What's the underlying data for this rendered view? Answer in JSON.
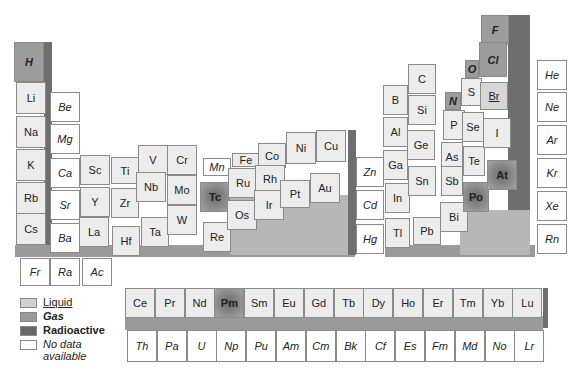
{
  "legend": [
    {
      "key": "liquid",
      "label": "Liquid"
    },
    {
      "key": "gas",
      "label": "Gas"
    },
    {
      "key": "radioactive",
      "label": "Radioactive"
    },
    {
      "key": "nodata",
      "label": "No data available"
    }
  ],
  "elements": [
    {
      "symbol": "H",
      "state": "gas"
    },
    {
      "symbol": "Li",
      "state": "solid"
    },
    {
      "symbol": "Na",
      "state": "solid"
    },
    {
      "symbol": "K",
      "state": "solid"
    },
    {
      "symbol": "Rb",
      "state": "solid"
    },
    {
      "symbol": "Cs",
      "state": "solid"
    },
    {
      "symbol": "Fr",
      "state": "nodata"
    },
    {
      "symbol": "Be",
      "state": "nodata"
    },
    {
      "symbol": "Mg",
      "state": "nodata"
    },
    {
      "symbol": "Ca",
      "state": "nodata"
    },
    {
      "symbol": "Sr",
      "state": "nodata"
    },
    {
      "symbol": "Ba",
      "state": "nodata"
    },
    {
      "symbol": "Ra",
      "state": "nodata"
    },
    {
      "symbol": "Sc",
      "state": "solid"
    },
    {
      "symbol": "Y",
      "state": "solid"
    },
    {
      "symbol": "La",
      "state": "solid"
    },
    {
      "symbol": "Ac",
      "state": "nodata"
    },
    {
      "symbol": "Ti",
      "state": "solid"
    },
    {
      "symbol": "Zr",
      "state": "solid"
    },
    {
      "symbol": "Hf",
      "state": "solid"
    },
    {
      "symbol": "V",
      "state": "solid"
    },
    {
      "symbol": "Nb",
      "state": "solid"
    },
    {
      "symbol": "Ta",
      "state": "solid"
    },
    {
      "symbol": "Cr",
      "state": "solid"
    },
    {
      "symbol": "Mo",
      "state": "solid"
    },
    {
      "symbol": "W",
      "state": "solid"
    },
    {
      "symbol": "Mn",
      "state": "nodata"
    },
    {
      "symbol": "Tc",
      "state": "radioactive"
    },
    {
      "symbol": "Re",
      "state": "solid"
    },
    {
      "symbol": "Fe",
      "state": "solid"
    },
    {
      "symbol": "Ru",
      "state": "solid"
    },
    {
      "symbol": "Os",
      "state": "solid"
    },
    {
      "symbol": "Co",
      "state": "solid"
    },
    {
      "symbol": "Rh",
      "state": "solid"
    },
    {
      "symbol": "Ir",
      "state": "solid"
    },
    {
      "symbol": "Ni",
      "state": "solid"
    },
    {
      "symbol": "Pt",
      "state": "solid"
    },
    {
      "symbol": "Cu",
      "state": "solid"
    },
    {
      "symbol": "Au",
      "state": "solid"
    },
    {
      "symbol": "Zn",
      "state": "nodata"
    },
    {
      "symbol": "Cd",
      "state": "nodata"
    },
    {
      "symbol": "Hg",
      "state": "nodata"
    },
    {
      "symbol": "B",
      "state": "solid"
    },
    {
      "symbol": "Al",
      "state": "solid"
    },
    {
      "symbol": "Ga",
      "state": "solid"
    },
    {
      "symbol": "In",
      "state": "solid"
    },
    {
      "symbol": "Tl",
      "state": "solid"
    },
    {
      "symbol": "C",
      "state": "solid"
    },
    {
      "symbol": "Si",
      "state": "solid"
    },
    {
      "symbol": "Ge",
      "state": "solid"
    },
    {
      "symbol": "Sn",
      "state": "solid"
    },
    {
      "symbol": "Pb",
      "state": "solid"
    },
    {
      "symbol": "N",
      "state": "gas"
    },
    {
      "symbol": "P",
      "state": "solid"
    },
    {
      "symbol": "As",
      "state": "solid"
    },
    {
      "symbol": "Sb",
      "state": "solid"
    },
    {
      "symbol": "Bi",
      "state": "solid"
    },
    {
      "symbol": "O",
      "state": "gas"
    },
    {
      "symbol": "S",
      "state": "solid"
    },
    {
      "symbol": "Se",
      "state": "solid"
    },
    {
      "symbol": "Te",
      "state": "solid"
    },
    {
      "symbol": "Po",
      "state": "radioactive"
    },
    {
      "symbol": "F",
      "state": "gas"
    },
    {
      "symbol": "Cl",
      "state": "gas"
    },
    {
      "symbol": "Br",
      "state": "liquid"
    },
    {
      "symbol": "I",
      "state": "solid"
    },
    {
      "symbol": "At",
      "state": "radioactive"
    },
    {
      "symbol": "He",
      "state": "nodata"
    },
    {
      "symbol": "Ne",
      "state": "nodata"
    },
    {
      "symbol": "Ar",
      "state": "nodata"
    },
    {
      "symbol": "Kr",
      "state": "nodata"
    },
    {
      "symbol": "Xe",
      "state": "nodata"
    },
    {
      "symbol": "Rn",
      "state": "nodata"
    }
  ],
  "lanthanides": [
    {
      "symbol": "Ce",
      "state": "solid"
    },
    {
      "symbol": "Pr",
      "state": "solid"
    },
    {
      "symbol": "Nd",
      "state": "solid"
    },
    {
      "symbol": "Pm",
      "state": "radioactive"
    },
    {
      "symbol": "Sm",
      "state": "solid"
    },
    {
      "symbol": "Eu",
      "state": "solid"
    },
    {
      "symbol": "Gd",
      "state": "solid"
    },
    {
      "symbol": "Tb",
      "state": "solid"
    },
    {
      "symbol": "Dy",
      "state": "solid"
    },
    {
      "symbol": "Ho",
      "state": "solid"
    },
    {
      "symbol": "Er",
      "state": "solid"
    },
    {
      "symbol": "Tm",
      "state": "solid"
    },
    {
      "symbol": "Yb",
      "state": "solid"
    },
    {
      "symbol": "Lu",
      "state": "solid"
    }
  ],
  "actinides": [
    {
      "symbol": "Th",
      "state": "nodata"
    },
    {
      "symbol": "Pa",
      "state": "nodata"
    },
    {
      "symbol": "U",
      "state": "nodata"
    },
    {
      "symbol": "Np",
      "state": "nodata"
    },
    {
      "symbol": "Pu",
      "state": "nodata"
    },
    {
      "symbol": "Am",
      "state": "nodata"
    },
    {
      "symbol": "Cm",
      "state": "nodata"
    },
    {
      "symbol": "Bk",
      "state": "nodata"
    },
    {
      "symbol": "Cf",
      "state": "nodata"
    },
    {
      "symbol": "Es",
      "state": "nodata"
    },
    {
      "symbol": "Fm",
      "state": "nodata"
    },
    {
      "symbol": "Md",
      "state": "nodata"
    },
    {
      "symbol": "No",
      "state": "nodata"
    },
    {
      "symbol": "Lr",
      "state": "nodata"
    }
  ]
}
